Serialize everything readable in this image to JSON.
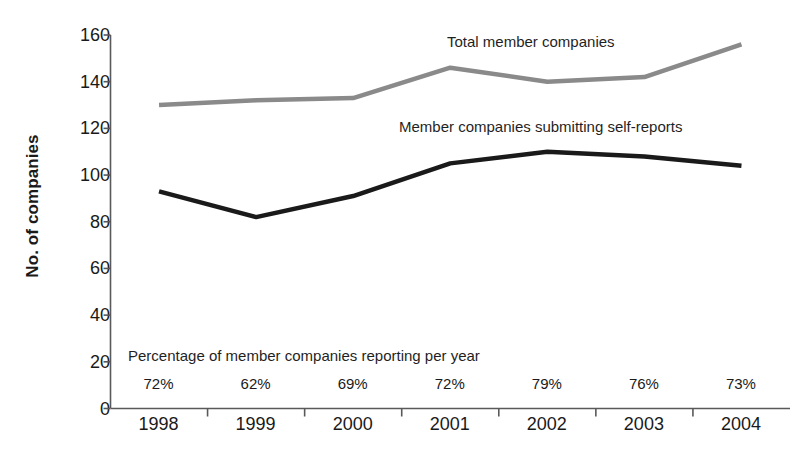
{
  "chart_data": {
    "type": "line",
    "title": "",
    "subtitle": "",
    "xlabel": "",
    "ylabel": "No. of companies",
    "categories": [
      "1998",
      "1999",
      "2000",
      "2001",
      "2002",
      "2003",
      "2004"
    ],
    "ylim": [
      0,
      160
    ],
    "yticks": [
      0,
      20,
      40,
      60,
      80,
      100,
      120,
      140,
      160
    ],
    "ytick_labels": [
      "0",
      "20",
      "40",
      "60",
      "80",
      "100",
      "120",
      "140",
      "160"
    ],
    "grid": false,
    "legend_position": "inline-labels",
    "series": [
      {
        "name": "Total member companies",
        "color": "#8a8a8a",
        "values": [
          130,
          132,
          133,
          146,
          140,
          142,
          156
        ]
      },
      {
        "name": "Member companies submitting self-reports",
        "color": "#1a1a1a",
        "values": [
          93,
          82,
          91,
          105,
          110,
          108,
          104
        ]
      }
    ],
    "annotations": {
      "percentage_caption": "Percentage of member companies reporting per year",
      "percentage_values": [
        "72%",
        "62%",
        "69%",
        "72%",
        "79%",
        "76%",
        "73%"
      ]
    }
  },
  "axis": {
    "y_title": "No. of companies"
  },
  "series_labels": {
    "total": "Total member companies",
    "self_reports": "Member companies submitting self-reports"
  },
  "colors": {
    "total_line": "#8a8a8a",
    "self_reports_line": "#1a1a1a",
    "axis": "#595959",
    "text": "#1a1a1a",
    "background": "#ffffff"
  }
}
